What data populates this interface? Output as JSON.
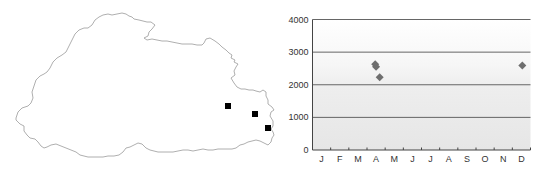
{
  "map": {
    "outline_color": "#9a9a9a",
    "marker_color": "#000000",
    "markers": [
      {
        "x": 228,
        "y": 106
      },
      {
        "x": 255,
        "y": 114
      },
      {
        "x": 268,
        "y": 128
      }
    ]
  },
  "chart_data": {
    "type": "scatter",
    "title": "",
    "xlabel": "",
    "ylabel": "",
    "categories": [
      "J",
      "F",
      "M",
      "A",
      "M",
      "J",
      "J",
      "A",
      "S",
      "O",
      "N",
      "D"
    ],
    "yticks": [
      "0",
      "1000",
      "2000",
      "3000",
      "4000"
    ],
    "ylim": [
      0,
      4000
    ],
    "grid": true,
    "marker_color": "#6e6e6e",
    "band_shading": "lighter grey upward fading from 0 to ~2500",
    "points": [
      {
        "month_pos": 3.45,
        "y": 2630
      },
      {
        "month_pos": 3.5,
        "y": 2550
      },
      {
        "month_pos": 3.7,
        "y": 2230
      },
      {
        "month_pos": 11.55,
        "y": 2590
      }
    ]
  }
}
